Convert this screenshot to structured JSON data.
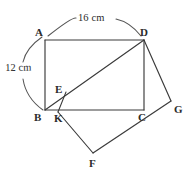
{
  "figure": {
    "stroke_color": "#3a3a3a",
    "arc_color": "#555555",
    "background": "#ffffff",
    "vertices": [
      {
        "id": "A",
        "label": "A",
        "x": 45,
        "y": 40
      },
      {
        "id": "D",
        "label": "D",
        "x": 144,
        "y": 40
      },
      {
        "id": "B",
        "label": "B",
        "x": 45,
        "y": 110
      },
      {
        "id": "C",
        "label": "C",
        "x": 144,
        "y": 110
      },
      {
        "id": "E",
        "label": "E",
        "x": 62,
        "y": 94
      },
      {
        "id": "K",
        "label": "K",
        "x": 58,
        "y": 112
      },
      {
        "id": "G",
        "label": "G",
        "x": 171,
        "y": 101
      },
      {
        "id": "F",
        "label": "F",
        "x": 93,
        "y": 153
      }
    ],
    "vertex_labels": [
      {
        "id": "A",
        "text": "A",
        "left": 35,
        "top": 27
      },
      {
        "id": "D",
        "text": "D",
        "left": 140,
        "top": 27
      },
      {
        "id": "B",
        "text": "B",
        "left": 34,
        "top": 112
      },
      {
        "id": "C",
        "text": "C",
        "left": 138,
        "top": 112
      },
      {
        "id": "E",
        "text": "E",
        "left": 55,
        "top": 84
      },
      {
        "id": "K",
        "text": "K",
        "left": 54,
        "top": 113
      },
      {
        "id": "G",
        "text": "G",
        "left": 174,
        "top": 104
      },
      {
        "id": "F",
        "text": "F",
        "left": 89,
        "top": 158
      }
    ],
    "segments": [
      {
        "name": "side-AD",
        "from": "A",
        "to": "D"
      },
      {
        "name": "side-AB",
        "from": "A",
        "to": "B"
      },
      {
        "name": "side-BC",
        "from": "B",
        "to": "C"
      },
      {
        "name": "side-DC",
        "from": "D",
        "to": "C"
      },
      {
        "name": "diagonal-BD",
        "from": "B",
        "to": "D"
      },
      {
        "name": "segment-DG",
        "from": "D",
        "to": "G"
      },
      {
        "name": "segment-GF",
        "from": "G",
        "to": "F"
      },
      {
        "name": "segment-FK",
        "from": "F",
        "to": "K"
      },
      {
        "name": "segment-KE",
        "from": "K",
        "to": "E"
      }
    ],
    "dimensions": [
      {
        "name": "top-width",
        "text": "16 cm",
        "left": 68,
        "top": 16,
        "applies_to": "AD"
      },
      {
        "name": "left-height",
        "text": "12 cm",
        "left": 6,
        "top": 63,
        "applies_to": "AB"
      }
    ],
    "arcs": [
      {
        "name": "top-dimension-arc",
        "d": "M 48 36 Q 95 10 141 36"
      },
      {
        "name": "left-dimension-arc",
        "d": "M 41 36 Q 22 74 42 110"
      }
    ]
  }
}
